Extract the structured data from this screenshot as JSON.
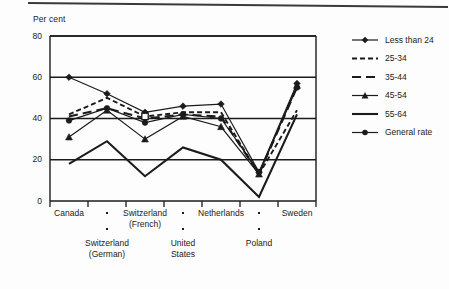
{
  "figure": {
    "background_color": "#fdfdfd",
    "ink_color": "#1b1b1b"
  },
  "chart_data": {
    "type": "line",
    "title": "",
    "subtitle": "",
    "xlabel": "",
    "ylabel": "Per cent",
    "ylim": [
      0,
      80
    ],
    "yticks": [
      0,
      20,
      40,
      60,
      80
    ],
    "ytick_labels": [
      "0",
      "20",
      "40",
      "60",
      "80"
    ],
    "grid": true,
    "grid_axis": "y",
    "legend_position": "right",
    "categories": [
      "Canada",
      "Switzerland (German)",
      "Switzerland (French)",
      "United States",
      "Netherlands",
      "Poland",
      "Sweden"
    ],
    "category_labels_top_row": [
      "Canada",
      "",
      "Switzerland\n(French)",
      "",
      "Netherlands",
      "",
      "Sweden"
    ],
    "category_labels_bottom_row": [
      "",
      "Switzerland\n(German)",
      "",
      "United\nStates",
      "",
      "Poland",
      ""
    ],
    "series": [
      {
        "name": "Less than 24",
        "marker": "diamond",
        "line_style": "solid",
        "values": [
          60,
          52,
          43,
          46,
          47,
          14,
          57
        ]
      },
      {
        "name": "25-34",
        "marker": "none",
        "line_style": "dashed-short",
        "values": [
          42,
          50,
          41,
          43,
          43,
          13,
          44
        ]
      },
      {
        "name": "35-44",
        "marker": "none",
        "line_style": "dashed-long",
        "values": [
          41,
          45,
          40,
          42,
          41,
          13,
          55
        ]
      },
      {
        "name": "45-54",
        "marker": "triangle",
        "line_style": "solid",
        "values": [
          31,
          44,
          30,
          41,
          36,
          13,
          56
        ]
      },
      {
        "name": "55-64",
        "marker": "none",
        "line_style": "solid-thick",
        "values": [
          18,
          29,
          12,
          26,
          20,
          2,
          42
        ]
      },
      {
        "name": "General rate",
        "marker": "circle",
        "line_style": "solid",
        "values": [
          39,
          45,
          38,
          42,
          40,
          14,
          55
        ]
      }
    ]
  },
  "legend": {
    "entries": [
      {
        "label": "Less than 24"
      },
      {
        "label": "25-34"
      },
      {
        "label": "35-44"
      },
      {
        "label": "45-54"
      },
      {
        "label": "55-64"
      },
      {
        "label": "General rate"
      }
    ]
  }
}
